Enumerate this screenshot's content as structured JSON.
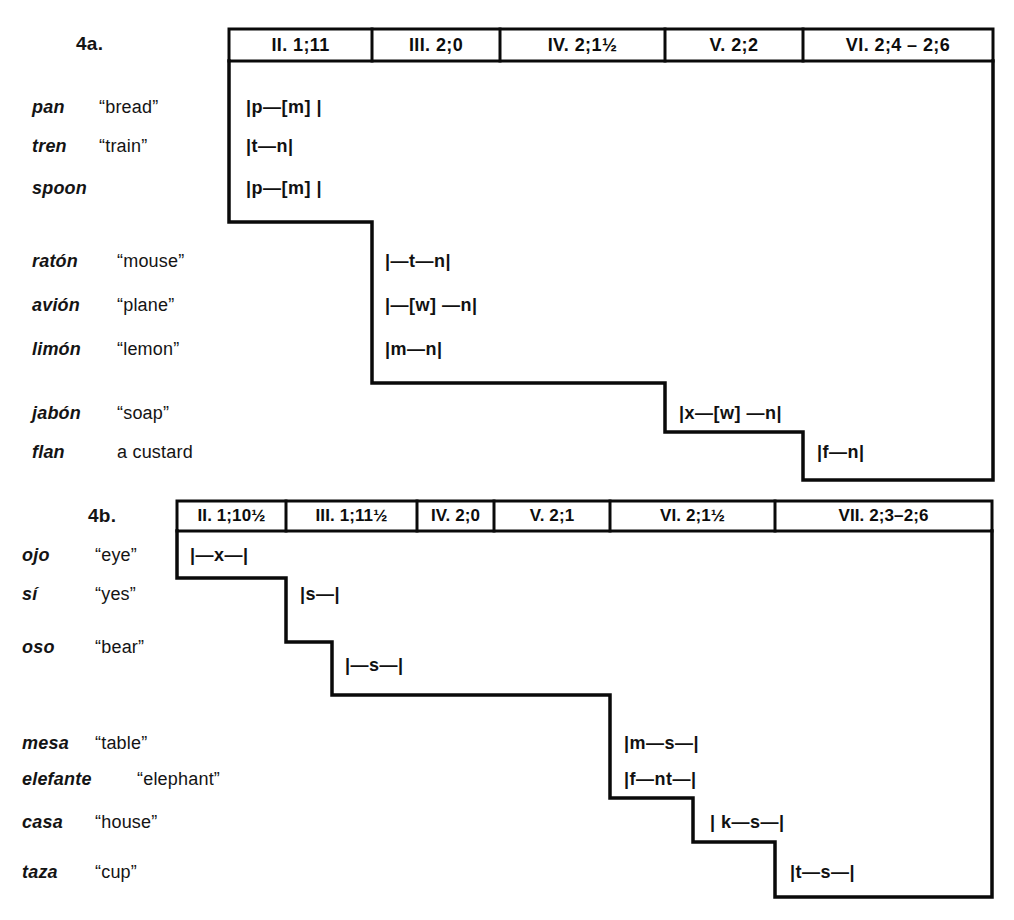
{
  "figure": {
    "panel_a": {
      "label": "4a.",
      "headers": [
        "II.  1;11",
        "III.  2;0",
        "IV.  2;1½",
        "V.  2;2",
        "VI.  2;4 – 2;6"
      ],
      "rows": [
        {
          "word": "pan",
          "gloss": "“bread”",
          "transcription": "|p—[m] |",
          "stage": 1
        },
        {
          "word": "tren",
          "gloss": "“train”",
          "transcription": "|t—n|",
          "stage": 1
        },
        {
          "word": "spoon",
          "gloss": "",
          "transcription": "|p—[m] |",
          "stage": 1
        },
        {
          "word": "ratón",
          "gloss": "“mouse”",
          "transcription": "|—t—n|",
          "stage": 2
        },
        {
          "word": "avión",
          "gloss": "“plane”",
          "transcription": "|—[w] —n|",
          "stage": 2
        },
        {
          "word": "limón",
          "gloss": "“lemon”",
          "transcription": "|m—n|",
          "stage": 2
        },
        {
          "word": "jabón",
          "gloss": "“soap”",
          "transcription": "|x—[w] —n|",
          "stage": 4
        },
        {
          "word": "flan",
          "gloss": "a custard",
          "transcription": "|f—n|",
          "stage": 5
        }
      ]
    },
    "panel_b": {
      "label": "4b.",
      "headers": [
        "II.  1;10½",
        "III.  1;11½",
        "IV. 2;0",
        "V.  2;1",
        "VI.  2;1½",
        "VII.  2;3–2;6"
      ],
      "rows": [
        {
          "word": "ojo",
          "gloss": "“eye”",
          "transcription": "|—x—|",
          "stage": 1
        },
        {
          "word": "sí",
          "gloss": "“yes”",
          "transcription": "|s—|",
          "stage": 2
        },
        {
          "word": "oso",
          "gloss": "“bear”",
          "transcription": "|—s—|",
          "stage": 3
        },
        {
          "word": "mesa",
          "gloss": "“table”",
          "transcription": "|m—s—|",
          "stage": 5
        },
        {
          "word": "elefante",
          "gloss": "“elephant”",
          "transcription": "|f—nt—|",
          "stage": 5
        },
        {
          "word": "casa",
          "gloss": "“house”",
          "transcription": "| k—s—|",
          "stage": 6
        },
        {
          "word": "taza",
          "gloss": "“cup”",
          "transcription": "|t—s—|",
          "stage": 7
        }
      ]
    }
  }
}
